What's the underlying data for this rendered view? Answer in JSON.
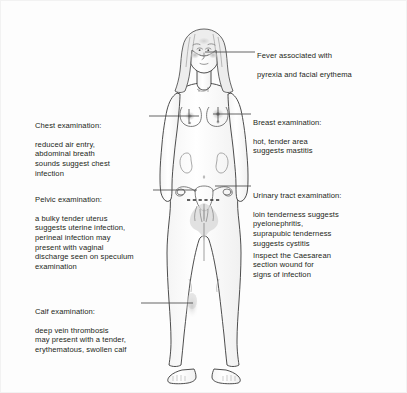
{
  "diagram": {
    "background_color": "#fdfdfd",
    "line_color": "#231f20",
    "shading_color": "#d8d8d8"
  },
  "annotations": [
    {
      "id": "fever",
      "name": "fever",
      "side": "right",
      "heading": "Fever associated with",
      "body": "pyrexia and facial erythema",
      "full_text": "Fever associated with pyrexia and facial erythema",
      "target": "face"
    },
    {
      "id": "chest",
      "name": "chest-examination",
      "side": "left",
      "heading": "Chest examination:",
      "body": "reduced air entry,\nabdominal breath\nsounds suggest chest\ninfection",
      "full_text": "Chest examination: reduced air entry, abdominal breath sounds suggest chest infection",
      "target": "chest"
    },
    {
      "id": "breast",
      "name": "breast-examination",
      "side": "right",
      "heading": "Breast examination:",
      "body": "hot, tender area\nsuggests mastitis",
      "full_text": "Breast examination: hot, tender area suggests mastitis",
      "target": "breast"
    },
    {
      "id": "pelvic",
      "name": "pelvic-examination",
      "side": "left",
      "heading": "Pelvic examination:",
      "body": "a bulky tender uterus\nsuggests uterine infection,\nperineal infection may\npresent with vaginal\ndischarge seen on speculum\nexamination",
      "full_text": "Pelvic examination: a bulky tender uterus suggests uterine infection, perineal infection may present with vaginal discharge seen on speculum examination",
      "target": "pelvis"
    },
    {
      "id": "urinary",
      "name": "urinary-tract-examination",
      "side": "right",
      "heading": "Urinary tract examination:",
      "body": "loin tenderness suggests\npyelonephritis,\nsuprapubic tenderness\nsuggests cystitis",
      "full_text": "Urinary tract examination: loin tenderness suggests pyelonephritis, suprapubic tenderness suggests cystitis",
      "target": "kidney"
    },
    {
      "id": "csection",
      "name": "caesarean-wound-inspection",
      "side": "right",
      "heading": "",
      "body": "Inspect the Caesarean\nsection wound for\nsigns of infection",
      "full_text": "Inspect the Caesarean section wound for signs of infection",
      "target": "caesarean-incision"
    },
    {
      "id": "calf",
      "name": "calf-examination",
      "side": "left",
      "heading": "Calf examination:",
      "body": "deep vein thrombosis\nmay present with a tender,\nerythematous, swollen calf",
      "full_text": "Calf examination: deep vein thrombosis may present with a tender, erythematous, swollen calf",
      "target": "calf"
    }
  ]
}
